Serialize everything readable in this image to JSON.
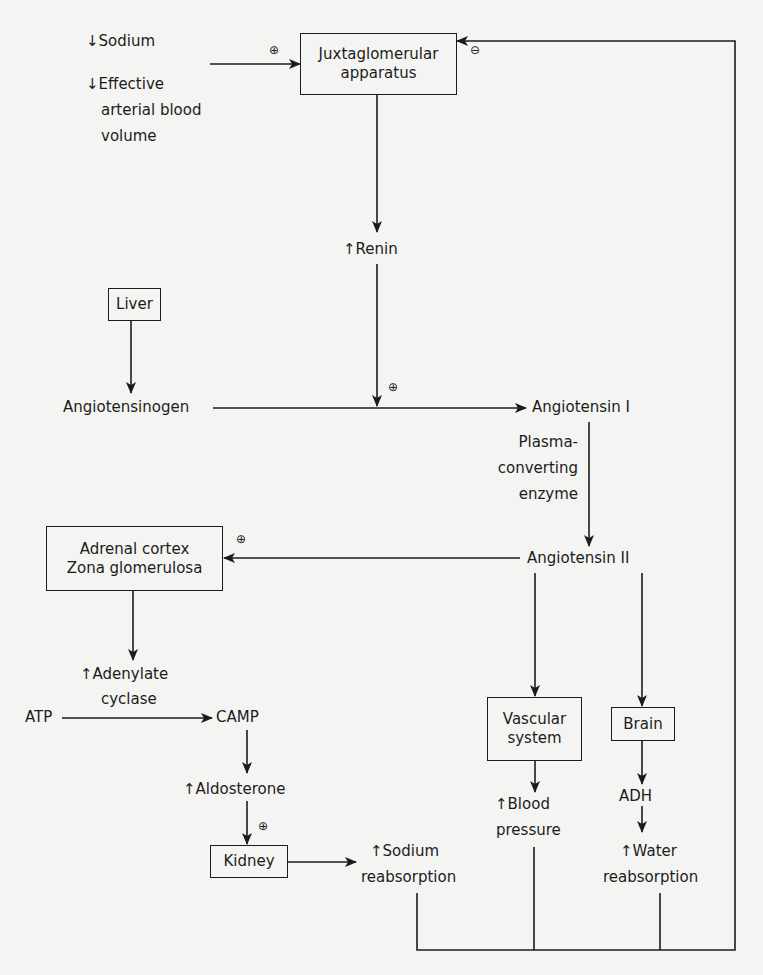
{
  "arrows": {
    "down": "↓",
    "up": "↑"
  },
  "signs": {
    "plus": "⊕",
    "minus": "⊖"
  },
  "stimuli": {
    "sodium": "Sodium",
    "volume_line1": "Effective",
    "volume_line2": "arterial blood",
    "volume_line3": "volume"
  },
  "nodes": {
    "jga_line1": "Juxtaglomerular",
    "jga_line2": "apparatus",
    "renin": "Renin",
    "liver": "Liver",
    "angiotensinogen": "Angiotensinogen",
    "angiotensin1": "Angiotensin I",
    "enzyme_line1": "Plasma-",
    "enzyme_line2": "converting",
    "enzyme_line3": "enzyme",
    "angiotensin2": "Angiotensin II",
    "adrenal_line1": "Adrenal cortex",
    "adrenal_line2": "Zona glomerulosa",
    "adenylate_line1": "Adenylate",
    "adenylate_line2": "cyclase",
    "atp": "ATP",
    "camp": "CAMP",
    "aldosterone": "Aldosterone",
    "kidney": "Kidney",
    "sodium_reabs_line1": "Sodium",
    "sodium_reabs_line2": "reabsorption",
    "vascular_line1": "Vascular",
    "vascular_line2": "system",
    "bp_line1": "Blood",
    "bp_line2": "pressure",
    "brain": "Brain",
    "adh": "ADH",
    "water_line1": "Water",
    "water_line2": "reabsorption"
  },
  "colors": {
    "ink": "#1c1c1c",
    "paper": "#f4f4f2"
  }
}
